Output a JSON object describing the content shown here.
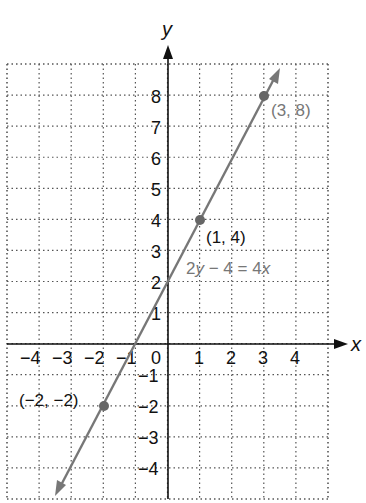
{
  "chart_data": {
    "type": "line",
    "title": "",
    "xlabel": "x",
    "ylabel": "y",
    "xlim": [
      -5,
      5
    ],
    "ylim": [
      -5,
      9
    ],
    "grid": true,
    "grid_style": "dotted",
    "x_ticks": [
      "−4",
      "−3",
      "−2",
      "−1",
      "0",
      "1",
      "2",
      "3",
      "4"
    ],
    "y_ticks": [
      "8",
      "7",
      "6",
      "5",
      "4",
      "3",
      "2",
      "1",
      "−1",
      "−2",
      "−3",
      "−4"
    ],
    "series": [
      {
        "name": "2y − 4 = 4x",
        "equation": "y = 2x + 2",
        "slope": 2,
        "intercept": 2,
        "color": "#777777",
        "x": [
          -2,
          1,
          3
        ],
        "y": [
          -2,
          4,
          8
        ]
      }
    ],
    "points": [
      {
        "x": 3,
        "y": 8,
        "label": "(3, 8)",
        "label_color": "#777777"
      },
      {
        "x": 1,
        "y": 4,
        "label": "(1, 4)",
        "label_color": "#111111"
      },
      {
        "x": -2,
        "y": -2,
        "label": "(−2, −2)",
        "label_color": "#111111"
      }
    ],
    "annotations": [
      {
        "text": "2y − 4 = 4x",
        "parts": [
          "2",
          "y",
          " − 4 = 4",
          "x"
        ],
        "color": "#777777"
      }
    ]
  },
  "colors": {
    "axis": "#111111",
    "grid": "#555555",
    "line": "#777777",
    "point": "#666666"
  }
}
